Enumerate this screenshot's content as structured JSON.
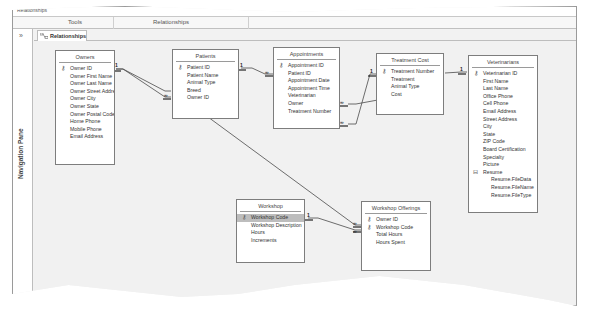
{
  "ribbon": {
    "top_label": "Relationships",
    "groups": [
      {
        "label": "Tools"
      },
      {
        "label": "Relationships"
      }
    ]
  },
  "nav_pane": {
    "collapse_glyph": "»",
    "label": "Navigation Pane"
  },
  "tabs": [
    {
      "label": "Relationships",
      "icon": "relationships-icon",
      "active": true
    }
  ],
  "tables": {
    "owners": {
      "title": "Owners",
      "fields": [
        {
          "name": "Owner ID",
          "key": true
        },
        {
          "name": "Owner First Name"
        },
        {
          "name": "Owner Last Name"
        },
        {
          "name": "Owner Street Address"
        },
        {
          "name": "Owner City"
        },
        {
          "name": "Owner State"
        },
        {
          "name": "Owner Postal Code"
        },
        {
          "name": "Home Phone"
        },
        {
          "name": "Mobile Phone"
        },
        {
          "name": "Email Address"
        }
      ]
    },
    "patients": {
      "title": "Patients",
      "fields": [
        {
          "name": "Patient ID",
          "key": true
        },
        {
          "name": "Patient Name"
        },
        {
          "name": "Animal Type"
        },
        {
          "name": "Breed"
        },
        {
          "name": "Owner ID"
        }
      ]
    },
    "appointments": {
      "title": "Appointments",
      "fields": [
        {
          "name": "Appointment ID",
          "key": true
        },
        {
          "name": "Patient ID"
        },
        {
          "name": "Appointment Date"
        },
        {
          "name": "Appointment Time"
        },
        {
          "name": "Veterinarian"
        },
        {
          "name": "Owner"
        },
        {
          "name": "Treatment Number"
        }
      ]
    },
    "treatment_cost": {
      "title": "Treatment Cost",
      "fields": [
        {
          "name": "Treatment Number",
          "key": true
        },
        {
          "name": "Treatment"
        },
        {
          "name": "Animal Type"
        },
        {
          "name": "Cost"
        }
      ]
    },
    "veterinarians": {
      "title": "Veterinarians",
      "fields": [
        {
          "name": "Veterinarian ID",
          "key": true
        },
        {
          "name": "First Name"
        },
        {
          "name": "Last Name"
        },
        {
          "name": "Office Phone"
        },
        {
          "name": "Cell Phone"
        },
        {
          "name": "Email Address"
        },
        {
          "name": "Street Address"
        },
        {
          "name": "City"
        },
        {
          "name": "State"
        },
        {
          "name": "ZIP Code"
        },
        {
          "name": "Board Certification"
        },
        {
          "name": "Specialty"
        },
        {
          "name": "Picture"
        },
        {
          "name": "Resume",
          "expander": "⊟"
        },
        {
          "name": "Resume.FileData",
          "sub": true
        },
        {
          "name": "Resume.FileName",
          "sub": true
        },
        {
          "name": "Resume.FileType",
          "sub": true
        }
      ]
    },
    "workshop": {
      "title": "Workshop",
      "fields": [
        {
          "name": "Workshop Code",
          "key": true,
          "selected": true
        },
        {
          "name": "Workshop Description"
        },
        {
          "name": "Hours"
        },
        {
          "name": "Increments"
        }
      ]
    },
    "workshop_offerings": {
      "title": "Workshop Offerings",
      "fields": [
        {
          "name": "Owner ID",
          "key": true
        },
        {
          "name": "Workshop Code",
          "key": true
        },
        {
          "name": "Total Hours"
        },
        {
          "name": "Hours Spent"
        }
      ]
    }
  },
  "relationships": {
    "one": "1",
    "many": "∞",
    "key_glyph": "🗝"
  }
}
